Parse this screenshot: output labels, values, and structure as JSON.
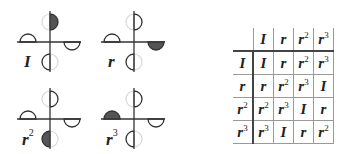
{
  "figures": [
    {
      "id": "I",
      "label": "I",
      "exponent": "",
      "filled_position": "top",
      "left": 0,
      "top": 0
    },
    {
      "id": "r",
      "label": "r",
      "exponent": "",
      "filled_position": "right",
      "left": 84,
      "top": 0
    },
    {
      "id": "r2",
      "label": "r",
      "exponent": "2",
      "filled_position": "bottom",
      "left": 0,
      "top": 77
    },
    {
      "id": "r3",
      "label": "r",
      "exponent": "3",
      "filled_position": "left",
      "left": 84,
      "top": 77
    }
  ],
  "cayley_table": {
    "header": [
      {
        "base": "",
        "exp": ""
      },
      {
        "base": "I",
        "exp": ""
      },
      {
        "base": "r",
        "exp": ""
      },
      {
        "base": "r",
        "exp": "2"
      },
      {
        "base": "r",
        "exp": "3"
      }
    ],
    "rows": [
      [
        {
          "base": "I",
          "exp": ""
        },
        {
          "base": "I",
          "exp": ""
        },
        {
          "base": "r",
          "exp": ""
        },
        {
          "base": "r",
          "exp": "2"
        },
        {
          "base": "r",
          "exp": "3"
        }
      ],
      [
        {
          "base": "r",
          "exp": ""
        },
        {
          "base": "r",
          "exp": ""
        },
        {
          "base": "r",
          "exp": "2"
        },
        {
          "base": "r",
          "exp": "3"
        },
        {
          "base": "I",
          "exp": ""
        }
      ],
      [
        {
          "base": "r",
          "exp": "2"
        },
        {
          "base": "r",
          "exp": "2"
        },
        {
          "base": "r",
          "exp": "3"
        },
        {
          "base": "I",
          "exp": ""
        },
        {
          "base": "r",
          "exp": ""
        }
      ],
      [
        {
          "base": "r",
          "exp": "3"
        },
        {
          "base": "r",
          "exp": "3"
        },
        {
          "base": "I",
          "exp": ""
        },
        {
          "base": "r",
          "exp": ""
        },
        {
          "base": "r",
          "exp": "2"
        }
      ]
    ]
  },
  "colors": {
    "line": "#333333",
    "fill": "#555555",
    "ghost": "#d8d8d8"
  }
}
